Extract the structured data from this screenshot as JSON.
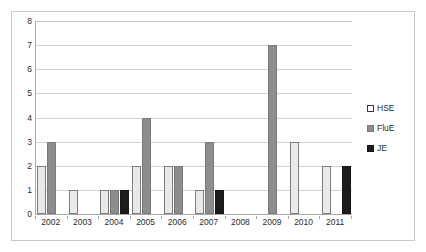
{
  "chart_data": {
    "type": "bar",
    "title": "",
    "subtitle": "",
    "xlabel": "",
    "ylabel": "",
    "categories": [
      "2002",
      "2003",
      "2004",
      "2005",
      "2006",
      "2007",
      "2008",
      "2009",
      "2010",
      "2011"
    ],
    "series": [
      {
        "name": "HSE",
        "color": "#e9e9e9",
        "values": [
          2,
          1,
          1,
          2,
          2,
          1,
          0,
          0,
          3,
          2
        ]
      },
      {
        "name": "FluE",
        "color": "#8d8d8d",
        "values": [
          3,
          0,
          1,
          4,
          2,
          3,
          0,
          7,
          0,
          0
        ]
      },
      {
        "name": "JE",
        "color": "#1c1c1c",
        "values": [
          0,
          0,
          1,
          0,
          0,
          1,
          0,
          0,
          0,
          2
        ]
      }
    ],
    "ylim": [
      0,
      8
    ],
    "y_ticks": [
      "0",
      "1",
      "2",
      "3",
      "4",
      "5",
      "6",
      "7",
      "8"
    ],
    "grid": "horizontal",
    "legend_position": "right"
  },
  "legend": {
    "entries": [
      {
        "label": "HSE",
        "swatch": "legend-swatch-hse"
      },
      {
        "label": "FluE",
        "swatch": "legend-swatch-flue"
      },
      {
        "label": "JE",
        "swatch": "legend-swatch-je"
      }
    ]
  }
}
